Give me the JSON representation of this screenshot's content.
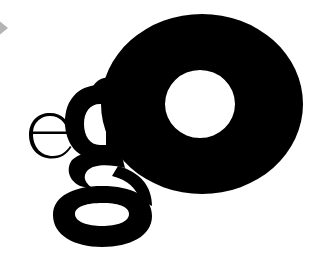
{
  "logo": {
    "wordmark": "ego",
    "letters": [
      {
        "char": "e",
        "style": "thin-serif"
      },
      {
        "char": "g",
        "style": "bold-serif"
      },
      {
        "char": "o",
        "style": "ultra-bold"
      }
    ]
  },
  "colors": {
    "background": "#ffffff",
    "ink": "#000000",
    "accent_shape": "#b4b4b4"
  },
  "decorations": {
    "corner_shape": "grey-diamond-arrow-icon"
  }
}
